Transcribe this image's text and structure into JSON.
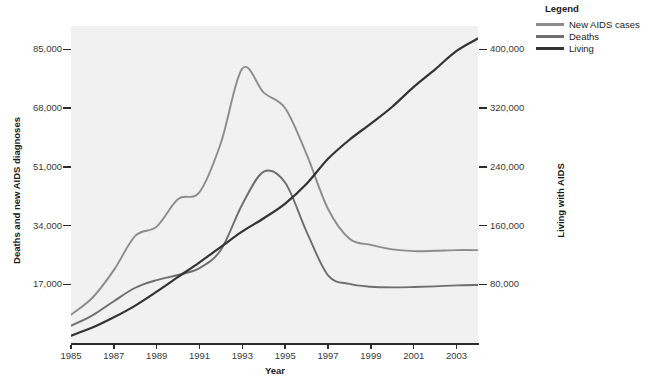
{
  "chart_data": {
    "type": "line",
    "title": "",
    "xlabel": "Year",
    "ylabel": "Deaths and new AIDS diagnoses",
    "y2label": "Living with AIDS",
    "grid": false,
    "legend_position": "top-right",
    "legend_title": "Legend",
    "xlim": [
      1985,
      2004
    ],
    "ylim": [
      0,
      91800
    ],
    "y2lim": [
      0,
      432000
    ],
    "xticks": [
      1985,
      1987,
      1989,
      1991,
      1993,
      1995,
      1997,
      1999,
      2001,
      2003
    ],
    "xtick_labels": [
      "1985",
      "1987",
      "1989",
      "1991",
      "1993",
      "1995",
      "1997",
      "1999",
      "2001",
      "2003"
    ],
    "yticks": [
      17000,
      34000,
      51000,
      68000,
      85000
    ],
    "ytick_labels": [
      "17,000",
      "34,000",
      "51,000",
      "68,000",
      "85,000"
    ],
    "y2ticks": [
      80000,
      160000,
      240000,
      320000,
      400000
    ],
    "y2tick_labels": [
      "80,000",
      "160,000",
      "240,000",
      "320,000",
      "400,000"
    ],
    "x": [
      1985,
      1986,
      1987,
      1988,
      1989,
      1990,
      1991,
      1992,
      1993,
      1994,
      1995,
      1996,
      1997,
      1998,
      1999,
      2000,
      2001,
      2002,
      2003,
      2004
    ],
    "series": [
      {
        "name": "New AIDS cases",
        "axis": "left",
        "color": "#8c8c8c",
        "values": [
          8200,
          13100,
          21100,
          31000,
          33700,
          41700,
          43700,
          58000,
          79500,
          72500,
          68000,
          54600,
          38800,
          30200,
          28400,
          27100,
          26600,
          26700,
          26900,
          26900
        ]
      },
      {
        "name": "Deaths",
        "axis": "left",
        "color": "#6e6e6e",
        "values": [
          5000,
          8000,
          12100,
          16000,
          18200,
          19700,
          21700,
          27000,
          40200,
          49600,
          46400,
          32200,
          19600,
          17100,
          16300,
          16100,
          16200,
          16400,
          16700,
          16800
        ]
      },
      {
        "name": "Living",
        "axis": "right",
        "color": "#333333",
        "values": [
          10000,
          21000,
          35000,
          51000,
          70000,
          90000,
          110000,
          131000,
          152000,
          170000,
          190000,
          217000,
          251000,
          277000,
          299000,
          322000,
          349000,
          373000,
          398000,
          415000
        ]
      }
    ]
  }
}
